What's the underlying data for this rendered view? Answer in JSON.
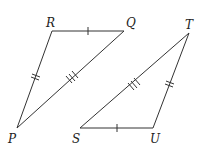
{
  "diagram": {
    "triangles": [
      {
        "name": "PQR",
        "vertices": {
          "R": {
            "label": "R",
            "x": 52,
            "y": 31
          },
          "Q": {
            "label": "Q",
            "x": 124,
            "y": 31
          },
          "P": {
            "label": "P",
            "x": 17,
            "y": 128
          }
        },
        "sides": [
          {
            "from": "R",
            "to": "Q",
            "ticks": 1
          },
          {
            "from": "R",
            "to": "P",
            "ticks": 2
          },
          {
            "from": "Q",
            "to": "P",
            "ticks": 3
          }
        ]
      },
      {
        "name": "STU",
        "vertices": {
          "T": {
            "label": "T",
            "x": 189,
            "y": 33
          },
          "S": {
            "label": "S",
            "x": 80,
            "y": 128
          },
          "U": {
            "label": "U",
            "x": 153,
            "y": 128
          }
        },
        "sides": [
          {
            "from": "S",
            "to": "U",
            "ticks": 1
          },
          {
            "from": "U",
            "to": "T",
            "ticks": 2
          },
          {
            "from": "S",
            "to": "T",
            "ticks": 3
          }
        ]
      }
    ],
    "labels": {
      "R": "R",
      "Q": "Q",
      "P": "P",
      "S": "S",
      "U": "U",
      "T": "T"
    }
  }
}
